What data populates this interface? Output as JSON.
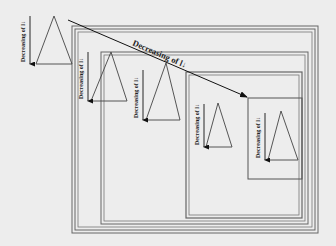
{
  "diagram": {
    "main_arrow_label": "Decreasing of l↓",
    "vertical_labels": [
      "Decreasing of l↓",
      "Decreasing of l↓",
      "Decreasing of l↓",
      "Decreasing of l↓",
      "Decreasing of l↓"
    ],
    "colors": {
      "background": "#ededed",
      "line": "#555555",
      "arrow": "#111111"
    }
  }
}
